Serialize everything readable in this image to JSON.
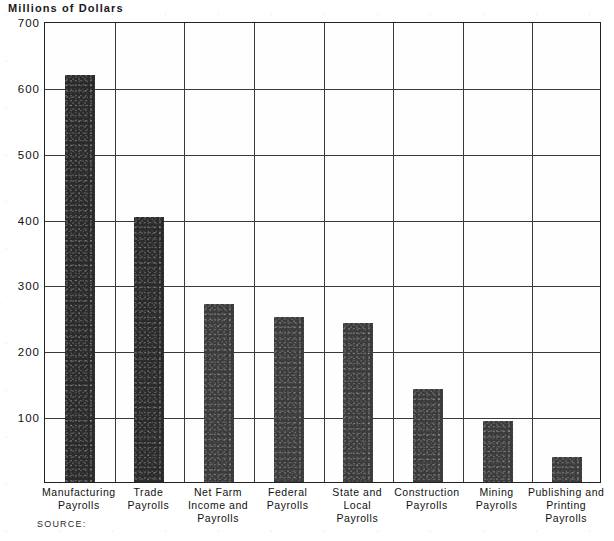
{
  "chart_data": {
    "type": "bar",
    "title": "Millions of Dollars",
    "xlabel": "",
    "ylabel": "Millions of Dollars",
    "ylim": [
      0,
      700
    ],
    "yticks": [
      700,
      600,
      500,
      400,
      300,
      200,
      100
    ],
    "grid": true,
    "legend": null,
    "bar_color": "#2a2a2a",
    "categories": [
      "Manufacturing Payrolls",
      "Trade Payrolls",
      "Net Farm Income and Payrolls",
      "Federal Payrolls",
      "State and Local Payrolls",
      "Construction Payrolls",
      "Mining Payrolls",
      "Publishing and Printing Payrolls"
    ],
    "values": [
      618,
      402,
      271,
      251,
      241,
      141,
      92,
      38
    ]
  },
  "chart": {
    "title": "Millions of Dollars",
    "source_label": "SOURCE:",
    "y_ticks": [
      {
        "label": "700",
        "value": 700
      },
      {
        "label": "600",
        "value": 600
      },
      {
        "label": "500",
        "value": 500
      },
      {
        "label": "400",
        "value": 400
      },
      {
        "label": "300",
        "value": 300
      },
      {
        "label": "200",
        "value": 200
      },
      {
        "label": "100",
        "value": 100
      }
    ],
    "bars": [
      {
        "value": 618,
        "label_lines": [
          "Manufacturing",
          "Payrolls"
        ]
      },
      {
        "value": 402,
        "label_lines": [
          "Trade",
          "Payrolls"
        ]
      },
      {
        "value": 271,
        "label_lines": [
          "Net Farm",
          "Income and",
          "Payrolls"
        ]
      },
      {
        "value": 251,
        "label_lines": [
          "Federal",
          "Payrolls"
        ]
      },
      {
        "value": 241,
        "label_lines": [
          "State and",
          "Local",
          "Payrolls"
        ]
      },
      {
        "value": 141,
        "label_lines": [
          "Construction",
          "Payrolls"
        ]
      },
      {
        "value": 92,
        "label_lines": [
          "Mining",
          "Payrolls"
        ]
      },
      {
        "value": 38,
        "label_lines": [
          "Publishing and",
          "Printing",
          "Payrolls"
        ]
      }
    ]
  }
}
